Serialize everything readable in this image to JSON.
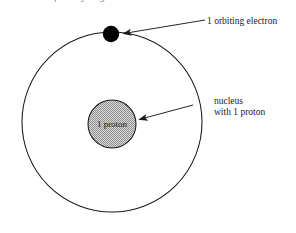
{
  "figure": {
    "caption_clipped": "Bohr model for a hydrogen atom",
    "background_color": "#ffffff",
    "line_color": "#1a1a1a",
    "electron_color": "#000000",
    "nucleus_fill_color": "#b8b8b8"
  },
  "diagram_data": {
    "type": "diagram",
    "subject": "Bohr model of the hydrogen atom",
    "elements": [
      {
        "name": "orbit",
        "shape": "circle",
        "center": [
          112,
          122
        ],
        "radius": 90,
        "fill": "none",
        "stroke": "#1a1a1a"
      },
      {
        "name": "electron",
        "shape": "filled-circle",
        "center": [
          111,
          34
        ],
        "radius": 8,
        "fill": "#000000"
      },
      {
        "name": "nucleus",
        "shape": "stippled-circle",
        "center": [
          112,
          124
        ],
        "radius": 24,
        "fill": "#b8b8b8",
        "stroke": "#1a1a1a"
      }
    ]
  },
  "labels": {
    "electron": {
      "text": "1 orbiting electron",
      "x": 207,
      "y": 24
    },
    "nucleus_line1": {
      "text": "nucleus",
      "x": 214,
      "y": 104
    },
    "nucleus_line2": {
      "text": "with 1 proton",
      "x": 214,
      "y": 115
    },
    "proton": {
      "text": "1 proton",
      "x": 112,
      "y": 127
    }
  },
  "annotations": {
    "electron_arrow": {
      "name": "arrow-to-electron",
      "from": [
        205,
        20
      ],
      "to": [
        121,
        34
      ]
    },
    "nucleus_arrow": {
      "name": "arrow-to-nucleus",
      "from": [
        193,
        105
      ],
      "to": [
        137,
        120
      ]
    }
  }
}
